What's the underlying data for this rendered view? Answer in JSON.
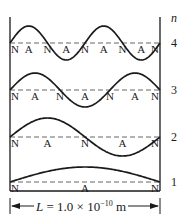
{
  "diagram": {
    "n_header": "n",
    "box": {
      "left": 10,
      "right": 160,
      "top": 17,
      "bottom": 191
    },
    "modes": [
      {
        "n": "4",
        "baseline_y": 43,
        "amplitude": 17,
        "labels": [
          "N",
          "A",
          "N",
          "A",
          "N",
          "A",
          "N",
          "A",
          "N"
        ]
      },
      {
        "n": "3",
        "baseline_y": 90,
        "amplitude": 17,
        "labels": [
          "N",
          "A",
          "N",
          "A",
          "N",
          "A",
          "N"
        ]
      },
      {
        "n": "2",
        "baseline_y": 137,
        "amplitude": 19,
        "labels": [
          "N",
          "A",
          "N",
          "A",
          "N"
        ]
      },
      {
        "n": "1",
        "baseline_y": 182,
        "amplitude": 15,
        "labels": [
          "N",
          "A",
          "N"
        ]
      }
    ],
    "legend": {
      "N": "node",
      "A": "antinode"
    },
    "dimension": {
      "symbol": "L",
      "equals": " = 1.0 × 10",
      "exponent": "−10",
      "unit": " m"
    },
    "colors": {
      "line": "#1a1a1a",
      "dash": "#555555",
      "background": "#ffffff"
    }
  }
}
